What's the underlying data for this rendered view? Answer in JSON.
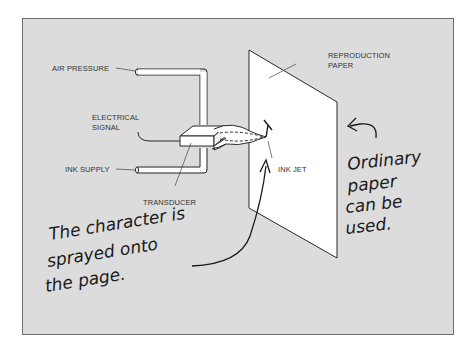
{
  "diagram": {
    "type": "inkjet-printer-schematic",
    "colors": {
      "background": "#ffffff",
      "panel": "#dcdcdc",
      "panel_border": "#6e6e6e",
      "paper": "#ffffff",
      "line": "#2a2a2a"
    },
    "labels": {
      "air_pressure": "AIR PRESSURE",
      "electrical_signal_line1": "ELECTRICAL",
      "electrical_signal_line2": "SIGNAL",
      "ink_supply": "INK SUPPLY",
      "transducer": "TRANSDUCER",
      "reproduction_paper_line1": "REPRODUCTION",
      "reproduction_paper_line2": "PAPER",
      "ink_jet": "INK JET",
      "printed_character": "T"
    },
    "annotations": {
      "character_sprayed": {
        "line1": "The character is",
        "line2": "sprayed onto",
        "line3": "the page."
      },
      "ordinary_paper": {
        "line1": "Ordinary",
        "line2": "paper",
        "line3": "can be",
        "line4": "used."
      }
    }
  }
}
